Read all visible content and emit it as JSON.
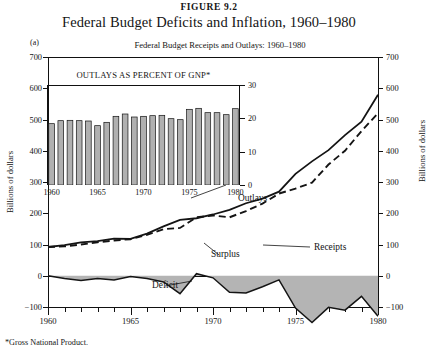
{
  "figure": {
    "number": "FIGURE 9.2",
    "title": "Federal Budget Deficits and Inflation, 1960–1980",
    "panel_label": "(a)",
    "footnote": "*Gross National Product."
  },
  "chart_data": {
    "type": "line",
    "title": "Federal Budget Receipts and Outlays:  1960–1980",
    "xlabel": "",
    "ylabel": "Billions of dollars",
    "ylabel_right": "Billions of dollars",
    "xlim": [
      1960,
      1980
    ],
    "ylim": [
      -100,
      700
    ],
    "yticks": [
      -100,
      0,
      100,
      200,
      300,
      400,
      500,
      600,
      700
    ],
    "xticks": [
      1960,
      1965,
      1970,
      1975,
      1980
    ],
    "grid": false,
    "legend_position": "inline-annotations",
    "x": [
      1960,
      1961,
      1962,
      1963,
      1964,
      1965,
      1966,
      1967,
      1968,
      1969,
      1970,
      1971,
      1972,
      1973,
      1974,
      1975,
      1976,
      1977,
      1978,
      1979,
      1980
    ],
    "series": [
      {
        "name": "Outlays",
        "style": "solid",
        "values": [
          92,
          98,
          107,
          111,
          119,
          118,
          135,
          158,
          179,
          184,
          196,
          211,
          232,
          247,
          269,
          326,
          366,
          402,
          450,
          493,
          579
        ]
      },
      {
        "name": "Receipts",
        "style": "dashed",
        "values": [
          92,
          94,
          100,
          107,
          113,
          117,
          131,
          149,
          153,
          187,
          193,
          187,
          207,
          231,
          263,
          279,
          298,
          356,
          400,
          463,
          520
        ]
      },
      {
        "name": "Surplus or Deficit",
        "style": "shaded-area",
        "values": [
          0,
          -4,
          -7,
          -4,
          -6,
          -1,
          -4,
          -9,
          -26,
          3,
          -3,
          -24,
          -25,
          -16,
          -6,
          -47,
          -68,
          -46,
          -50,
          -30,
          -59
        ]
      }
    ],
    "annotations": [
      {
        "label": "Outlays",
        "x": 1973,
        "y": 400
      },
      {
        "label": "Receipts",
        "x": 1977,
        "y": 300
      },
      {
        "label": "Surplus",
        "x": 1969,
        "y": 60
      },
      {
        "label": "Deficit",
        "x": 1966,
        "y": -45
      }
    ]
  },
  "inset_chart_data": {
    "type": "bar",
    "title": "OUTLAYS AS PERCENT OF GNP*",
    "xlabel": "",
    "ylabel": "",
    "ylim": [
      0,
      30
    ],
    "yticks": [
      0,
      10,
      20,
      30
    ],
    "xticks": [
      1960,
      1965,
      1970,
      1975,
      1980
    ],
    "grid": false,
    "categories": [
      "1960",
      "1961",
      "1962",
      "1963",
      "1964",
      "1965",
      "1966",
      "1967",
      "1968",
      "1969",
      "1970",
      "1971",
      "1972",
      "1973",
      "1974",
      "1975",
      "1976",
      "1977",
      "1978",
      "1979",
      "1980"
    ],
    "values": [
      18.4,
      19.3,
      19.4,
      19.3,
      19.2,
      17.8,
      18.8,
      20.6,
      21.3,
      20.4,
      20.6,
      20.8,
      20.9,
      19.9,
      19.6,
      22.7,
      23.0,
      21.7,
      21.7,
      21.1,
      22.9
    ]
  },
  "axes": {
    "left_title": "Billions of dollars",
    "right_title": "Billions of dollars",
    "left_ticks": [
      "700",
      "600",
      "500",
      "400",
      "300",
      "200",
      "100",
      "0",
      "−100"
    ],
    "right_ticks": [
      "700",
      "600",
      "500",
      "400",
      "300",
      "200",
      "100",
      "0",
      "−100"
    ],
    "x_ticks": [
      "1960",
      "1965",
      "1970",
      "1975",
      "1980"
    ]
  },
  "inset_axes": {
    "right_ticks": [
      "30",
      "20",
      "10",
      "0"
    ],
    "x_ticks": [
      "1960",
      "1965",
      "1970",
      "1975",
      "1980"
    ]
  },
  "colors": {
    "ink": "#141414",
    "area_fill": "#b4b4b4",
    "bar_fill": "#b0b0b0",
    "background": "#ffffff"
  }
}
